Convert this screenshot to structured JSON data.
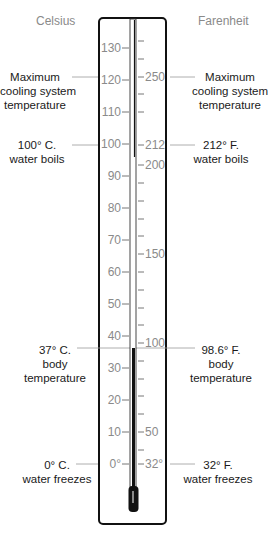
{
  "scales": {
    "celsius_title": "Celsius",
    "fahrenheit_title": "Farenheit"
  },
  "celsius_ticks": [
    "130",
    "120",
    "110",
    "100",
    "90",
    "80",
    "70",
    "60",
    "50",
    "40",
    "30",
    "20",
    "10",
    "0°"
  ],
  "fahrenheit_ticks": [
    "250",
    "212",
    "200",
    "150",
    "100",
    "50",
    "32°"
  ],
  "annotations": {
    "left": {
      "max_cooling": [
        "Maximum",
        "cooling system",
        "temperature"
      ],
      "boils": [
        "100° C.",
        "water boils"
      ],
      "body": [
        "37° C.",
        "body",
        "temperature"
      ],
      "freezes": [
        "0° C.",
        "water freezes"
      ]
    },
    "right": {
      "max_cooling": [
        "Maximum",
        "cooling system",
        "temperature"
      ],
      "boils": [
        "212° F.",
        "water boils"
      ],
      "body": [
        "98.6° F.",
        "body",
        "temperature"
      ],
      "freezes": [
        "32° F.",
        "water freezes"
      ]
    }
  },
  "colors": {
    "frame": "#111111",
    "tick_label": "#8a8a8a",
    "annotation_text": "#1a1a1a",
    "leader_line": "#9a9a9a",
    "mercury": "#111111"
  }
}
